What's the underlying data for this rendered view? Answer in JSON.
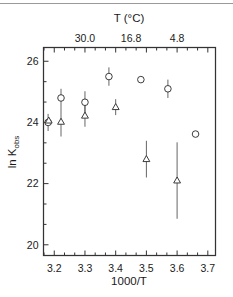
{
  "figure": {
    "background_color": "#ffffff",
    "line_color": "#2a2a2a",
    "marker_fill": "#ffffff",
    "top_rule": "decorative-horizontal-rule"
  },
  "chart_data": {
    "type": "scatter",
    "title": "",
    "xlabel": "1000/T",
    "ylabel": "ln K_obs",
    "ylabel_main": "ln K",
    "ylabel_sub": "obs",
    "xlim": [
      3.165,
      3.725
    ],
    "ylim": [
      19.65,
      26.45
    ],
    "grid": false,
    "legend": "none",
    "x_ticks_major": [
      3.2,
      3.3,
      3.4,
      3.5,
      3.6,
      3.7
    ],
    "x_tick_labels": [
      "3.2",
      "3.3",
      "3.4",
      "3.5",
      "3.6",
      "3.7"
    ],
    "x_minor_per_major": 2,
    "y_ticks_major": [
      20,
      22,
      24,
      26
    ],
    "y_tick_labels": [
      "20",
      "22",
      "24",
      "26"
    ],
    "y_minor_per_major": 2,
    "secondary_axis": {
      "label": "T (°C)",
      "position": "top",
      "tick_values_x": [
        3.3,
        3.45,
        3.6
      ],
      "tick_labels": [
        "30.0",
        "16.8",
        "4.8"
      ]
    },
    "series": [
      {
        "name": "circles",
        "marker": "circle",
        "points": [
          {
            "x": 3.18,
            "y": 24.0,
            "yerr": 0.28
          },
          {
            "x": 3.222,
            "y": 24.8,
            "yerr": 0.3
          },
          {
            "x": 3.3,
            "y": 24.66,
            "yerr": 0.36
          },
          {
            "x": 3.378,
            "y": 25.5,
            "yerr": 0.3
          },
          {
            "x": 3.482,
            "y": 25.4,
            "yerr": 0.0
          },
          {
            "x": 3.57,
            "y": 25.1,
            "yerr": 0.3
          },
          {
            "x": 3.66,
            "y": 23.62,
            "yerr": 0.0
          }
        ],
        "fit": {
          "type": "quadratic",
          "vertex_x": 3.405,
          "vertex_y": 25.55,
          "a": -36.0,
          "x_start": 3.17,
          "x_end": 3.72
        }
      },
      {
        "name": "triangles",
        "marker": "triangle",
        "points": [
          {
            "x": 3.182,
            "y": 24.06,
            "yerr": 0.1
          },
          {
            "x": 3.222,
            "y": 24.02,
            "yerr": 0.48
          },
          {
            "x": 3.3,
            "y": 24.22,
            "yerr": 0.36
          },
          {
            "x": 3.4,
            "y": 24.5,
            "yerr": 0.26
          },
          {
            "x": 3.5,
            "y": 22.8,
            "yerr": 0.6
          },
          {
            "x": 3.6,
            "y": 22.1,
            "yerr": 1.25
          }
        ],
        "fit": {
          "type": "quadratic",
          "vertex_x": 3.34,
          "vertex_y": 24.22,
          "a": -36.0,
          "x_start": 3.17,
          "x_end": 3.72
        }
      }
    ]
  }
}
